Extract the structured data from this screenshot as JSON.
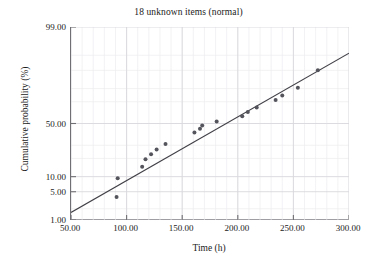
{
  "chart_data": {
    "type": "scatter",
    "title": "18 unknown items (normal)",
    "xlabel": "Time (h)",
    "ylabel": "Cumulative probability (%)",
    "xlim": [
      50.0,
      300.0
    ],
    "ylim": [
      1.0,
      99.0
    ],
    "y_scale": "normal-probability",
    "x_scale": "linear",
    "grid": true,
    "grid_color": "#e2e2e6",
    "legend": "none",
    "marker_color": "#54545c",
    "line_color": "#3f3f46",
    "xticks": [
      50.0,
      100.0,
      150.0,
      200.0,
      250.0,
      300.0
    ],
    "xtick_labels": [
      "50.00",
      "100.00",
      "150.00",
      "200.00",
      "250.00",
      "300.00"
    ],
    "x_minor_step": 10.0,
    "yticks": [
      1.0,
      5.0,
      10.0,
      50.0,
      99.0
    ],
    "ytick_labels": [
      "1.00",
      "5.00",
      "10.00",
      "50.00",
      "99.00"
    ],
    "y_minor_ticks": [
      2.0,
      20.0,
      30.0,
      70.0,
      80.0,
      90.0,
      95.0
    ],
    "n_items": 18,
    "series": [
      {
        "name": "unknown items",
        "x": [
          91.0,
          92.0,
          114.0,
          117.0,
          122.0,
          127.0,
          135.0,
          161.0,
          166.0,
          168.0,
          181.0,
          204.0,
          209.0,
          217.0,
          234.0,
          240.0,
          254.0,
          272.0
        ],
        "y": [
          3.8,
          9.3,
          14.8,
          19.5,
          23.0,
          26.5,
          31.0,
          41.5,
          45.0,
          48.0,
          52.0,
          57.0,
          61.0,
          65.0,
          71.5,
          75.0,
          80.5,
          90.0
        ]
      }
    ],
    "fit_line": {
      "name": "normal fit",
      "x": [
        50.0,
        300.0
      ],
      "y": [
        1.6,
        95.5
      ]
    }
  }
}
